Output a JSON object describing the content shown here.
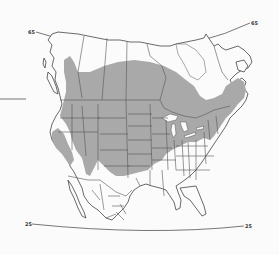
{
  "map": {
    "type": "species range map",
    "region": "North America",
    "latitude_labels": {
      "top_left": "65",
      "top_right": "65",
      "bottom_left": "25",
      "bottom_right": "25"
    },
    "colors": {
      "range_fill": "#a9a9a9",
      "outline": "#444444",
      "background": "#fbfbfb"
    }
  }
}
